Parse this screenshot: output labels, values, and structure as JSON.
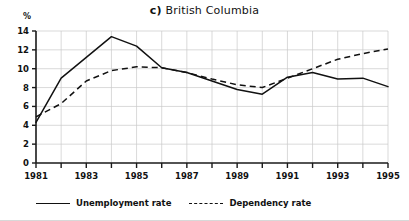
{
  "chart_data": {
    "type": "line",
    "title": "c)  British Columbia",
    "title_tag": "c)",
    "title_text": "British Columbia",
    "xlabel": "",
    "ylabel": "%",
    "yunit": "%",
    "xlim": [
      1981,
      1995
    ],
    "ylim": [
      0,
      14
    ],
    "yticks": [
      0,
      2,
      4,
      6,
      8,
      10,
      12,
      14
    ],
    "xticks": [
      1981,
      1982,
      1983,
      1984,
      1985,
      1986,
      1987,
      1988,
      1989,
      1990,
      1991,
      1992,
      1993,
      1994,
      1995
    ],
    "xtick_labels": [
      "1981",
      "",
      "1983",
      "",
      "1985",
      "",
      "1987",
      "",
      "1989",
      "",
      "1991",
      "",
      "1993",
      "",
      "1995"
    ],
    "grid": true,
    "legend_position": "below",
    "x": [
      1981,
      1982,
      1983,
      1984,
      1985,
      1986,
      1987,
      1988,
      1989,
      1990,
      1991,
      1992,
      1993,
      1994,
      1995
    ],
    "series": [
      {
        "name": "Unemployment rate",
        "style": "solid",
        "color": "#111111",
        "values": [
          4.3,
          9.0,
          11.2,
          13.4,
          12.4,
          10.1,
          9.6,
          8.7,
          7.8,
          7.3,
          9.1,
          9.6,
          8.9,
          9.0,
          8.1
        ]
      },
      {
        "name": "Dependency rate",
        "style": "dashed",
        "color": "#111111",
        "values": [
          4.9,
          6.3,
          8.7,
          9.8,
          10.2,
          10.1,
          9.6,
          8.9,
          8.3,
          8.0,
          9.0,
          10.0,
          11.0,
          11.6,
          12.1
        ]
      }
    ]
  },
  "legend": {
    "entries": [
      {
        "label": "Unemployment rate",
        "style": "solid"
      },
      {
        "label": "Dependency rate",
        "style": "dashed"
      }
    ]
  }
}
